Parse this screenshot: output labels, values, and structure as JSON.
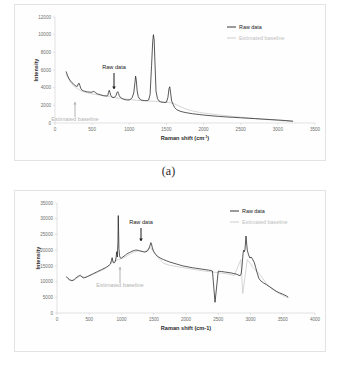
{
  "figure": {
    "panels": [
      {
        "caption": "(a)",
        "legend": [
          {
            "label": "Raw data",
            "color": "#222222"
          },
          {
            "label": "Estimated baseline",
            "color": "#c8c8c8"
          }
        ],
        "annotations": [
          {
            "text": "Raw data",
            "target": "raw-data",
            "arrow": "down",
            "color": "#1a1a1a"
          },
          {
            "text": "Estimated baseline",
            "target": "estimated-baseline",
            "arrow": "up",
            "color": "#b3b3b3"
          }
        ]
      },
      {
        "caption": "(b)",
        "legend": [
          {
            "label": "Raw data",
            "color": "#222222"
          },
          {
            "label": "Estimated baseline",
            "color": "#c8c8c8"
          }
        ],
        "annotations": [
          {
            "text": "Raw data",
            "target": "raw-data",
            "arrow": "down",
            "color": "#1a1a1a"
          },
          {
            "text": "Estimated baseline",
            "target": "estimated-baseline",
            "arrow": "up",
            "color": "#b3b3b3"
          }
        ]
      }
    ]
  },
  "chart_data": [
    {
      "type": "line",
      "title": "",
      "xlabel": "Raman shift (cm⁻¹)",
      "ylabel": "Intensity",
      "xlim": [
        0,
        3500
      ],
      "ylim": [
        0,
        12000
      ],
      "xticks": [
        0,
        500,
        1000,
        1500,
        2000,
        2500,
        3000,
        3500
      ],
      "yticks": [
        0,
        2000,
        4000,
        6000,
        8000,
        10000,
        12000
      ],
      "grid": false,
      "legend_position": "top-right",
      "series": [
        {
          "name": "Raw data",
          "color": "#222222",
          "x": [
            150,
            170,
            190,
            210,
            230,
            250,
            270,
            290,
            300,
            315,
            325,
            335,
            345,
            360,
            380,
            400,
            420,
            440,
            460,
            480,
            500,
            515,
            525,
            535,
            550,
            570,
            590,
            610,
            630,
            650,
            670,
            690,
            710,
            720,
            730,
            740,
            750,
            765,
            780,
            800,
            820,
            835,
            845,
            855,
            865,
            880,
            900,
            920,
            940,
            960,
            980,
            1000,
            1020,
            1040,
            1060,
            1075,
            1085,
            1095,
            1105,
            1120,
            1140,
            1160,
            1180,
            1200,
            1220,
            1240,
            1260,
            1280,
            1300,
            1315,
            1325,
            1335,
            1345,
            1360,
            1380,
            1400,
            1420,
            1440,
            1460,
            1480,
            1500,
            1520,
            1535,
            1545,
            1555,
            1570,
            1590,
            1610,
            1640,
            1680,
            1720,
            1760,
            1800,
            1850,
            1900,
            1950,
            2000,
            2100,
            2200,
            2300,
            2400,
            2500,
            2600,
            2700,
            2800,
            2900,
            3000,
            3100,
            3200
          ],
          "y": [
            5800,
            5350,
            5000,
            4750,
            4550,
            4400,
            4250,
            4150,
            4150,
            4450,
            4500,
            4250,
            3950,
            3750,
            3650,
            3600,
            3550,
            3520,
            3500,
            3480,
            3500,
            3560,
            3580,
            3520,
            3400,
            3300,
            3250,
            3200,
            3150,
            3100,
            3080,
            3060,
            3100,
            3450,
            3700,
            3450,
            3150,
            2950,
            2880,
            2900,
            3100,
            3450,
            3550,
            3350,
            3100,
            2900,
            2780,
            2700,
            2650,
            2620,
            2600,
            2620,
            2700,
            2900,
            3400,
            4500,
            5300,
            4800,
            3700,
            3000,
            2700,
            2600,
            2560,
            2540,
            2530,
            2540,
            2600,
            3200,
            6500,
            9200,
            10000,
            9400,
            7000,
            3600,
            2750,
            2500,
            2400,
            2350,
            2330,
            2320,
            2350,
            2900,
            3900,
            4100,
            3500,
            2500,
            2100,
            1750,
            1500,
            1350,
            1250,
            1180,
            1120,
            1050,
            1000,
            950,
            900,
            820,
            750,
            690,
            640,
            590,
            540,
            490,
            440,
            390,
            340,
            280,
            210
          ]
        },
        {
          "name": "Estimated baseline",
          "color": "#c8c8c8",
          "x": [
            150,
            200,
            250,
            300,
            350,
            400,
            450,
            500,
            550,
            600,
            650,
            700,
            750,
            800,
            850,
            900,
            950,
            1000,
            1050,
            1100,
            1150,
            1200,
            1250,
            1300,
            1350,
            1400,
            1450,
            1500,
            1550,
            1600,
            1650,
            1700,
            1750,
            1800,
            1850,
            1900,
            1950,
            2000,
            2100,
            2200,
            2300,
            2400,
            2500,
            2600,
            2700,
            2800,
            2900,
            3000,
            3100,
            3200
          ],
          "y": [
            5500,
            4700,
            4200,
            3900,
            3650,
            3480,
            3380,
            3300,
            3230,
            3150,
            3080,
            3010,
            2950,
            2890,
            2830,
            2770,
            2710,
            2660,
            2610,
            2570,
            2540,
            2510,
            2490,
            2470,
            2450,
            2430,
            2400,
            2360,
            2300,
            2180,
            2000,
            1800,
            1620,
            1480,
            1370,
            1280,
            1200,
            1130,
            1020,
            920,
            830,
            740,
            660,
            580,
            500,
            420,
            350,
            280,
            220,
            160
          ]
        }
      ]
    },
    {
      "type": "line",
      "title": "",
      "xlabel": "Raman shift (cm-1)",
      "ylabel": "Intensity",
      "xlim": [
        0,
        4000
      ],
      "ylim": [
        0,
        35000
      ],
      "xticks": [
        0,
        500,
        1000,
        1500,
        2000,
        2500,
        3000,
        3500,
        4000
      ],
      "yticks": [
        0,
        5000,
        10000,
        15000,
        20000,
        25000,
        30000,
        35000
      ],
      "grid": false,
      "legend_position": "top-right",
      "series": [
        {
          "name": "Raw data",
          "color": "#222222",
          "x": [
            150,
            170,
            190,
            210,
            230,
            250,
            270,
            290,
            310,
            330,
            350,
            365,
            375,
            390,
            410,
            430,
            450,
            470,
            490,
            510,
            530,
            550,
            570,
            590,
            610,
            630,
            650,
            670,
            690,
            710,
            730,
            750,
            770,
            790,
            810,
            830,
            845,
            855,
            865,
            875,
            885,
            895,
            905,
            915,
            925,
            935,
            945,
            950,
            955,
            960,
            970,
            980,
            990,
            1000,
            1020,
            1040,
            1060,
            1080,
            1100,
            1120,
            1140,
            1160,
            1180,
            1200,
            1220,
            1240,
            1260,
            1280,
            1300,
            1320,
            1340,
            1360,
            1380,
            1400,
            1420,
            1440,
            1455,
            1465,
            1475,
            1490,
            1510,
            1530,
            1550,
            1570,
            1600,
            1650,
            1700,
            1750,
            1800,
            1850,
            1900,
            1950,
            2000,
            2050,
            2100,
            2150,
            2200,
            2250,
            2300,
            2350,
            2390,
            2400,
            2410,
            2450,
            2500,
            2550,
            2600,
            2650,
            2700,
            2730,
            2760,
            2790,
            2820,
            2840,
            2855,
            2865,
            2875,
            2885,
            2895,
            2905,
            2915,
            2930,
            2950,
            2970,
            2990,
            3010,
            3030,
            3060,
            3080,
            3100,
            3130,
            3160,
            3200,
            3250,
            3300,
            3350,
            3400,
            3450,
            3500,
            3530,
            3560,
            3580
          ],
          "y": [
            11500,
            11000,
            10600,
            10400,
            10300,
            10450,
            10700,
            11100,
            11400,
            11700,
            11900,
            12000,
            11800,
            11400,
            11200,
            11250,
            11400,
            11600,
            11800,
            12000,
            12200,
            12400,
            12600,
            12800,
            13000,
            13200,
            13400,
            13600,
            13800,
            14000,
            14200,
            14400,
            14600,
            14900,
            15200,
            15600,
            16800,
            17600,
            16500,
            16000,
            15900,
            16100,
            16500,
            17500,
            19500,
            17800,
            22500,
            31000,
            26000,
            20500,
            18200,
            17600,
            17400,
            17500,
            17800,
            18100,
            18400,
            18700,
            19000,
            19200,
            19400,
            19600,
            19800,
            19900,
            20000,
            20000,
            19900,
            19800,
            19700,
            19600,
            19500,
            19400,
            19500,
            19700,
            20300,
            21300,
            22400,
            22000,
            21000,
            20000,
            19200,
            18600,
            18200,
            17900,
            17500,
            17000,
            16600,
            16200,
            15900,
            15600,
            15300,
            15000,
            14800,
            14600,
            14400,
            14250,
            14100,
            13950,
            13800,
            13650,
            13500,
            13400,
            13350,
            3400,
            13300,
            13200,
            13050,
            12900,
            12750,
            12600,
            12450,
            12300,
            12000,
            11900,
            12500,
            14000,
            16500,
            19000,
            20000,
            19500,
            20300,
            24500,
            20000,
            18500,
            17500,
            17800,
            17200,
            16000,
            14500,
            13000,
            11000,
            10200,
            9600,
            9000,
            8300,
            7600,
            6900,
            6400,
            6000,
            5700,
            5400,
            5100,
            4900,
            4700,
            4500
          ]
        },
        {
          "name": "Estimated baseline",
          "color": "#c8c8c8",
          "x": [
            150,
            250,
            350,
            450,
            550,
            650,
            750,
            850,
            950,
            1050,
            1150,
            1250,
            1350,
            1450,
            1550,
            1650,
            1750,
            1850,
            1950,
            2050,
            2150,
            2250,
            2350,
            2450,
            2550,
            2650,
            2750,
            2850,
            2880,
            2950,
            3050,
            3150,
            3250,
            3350,
            3450,
            3550,
            3580
          ],
          "y": [
            11200,
            10250,
            11700,
            11350,
            12150,
            13150,
            14150,
            16200,
            17000,
            17700,
            19000,
            19800,
            19400,
            20800,
            18100,
            15800,
            15200,
            14800,
            14450,
            14100,
            13750,
            13450,
            13200,
            12950,
            12700,
            12400,
            11950,
            17000,
            6200,
            17000,
            14200,
            12200,
            9200,
            7400,
            6100,
            5100,
            4800
          ]
        }
      ]
    }
  ]
}
